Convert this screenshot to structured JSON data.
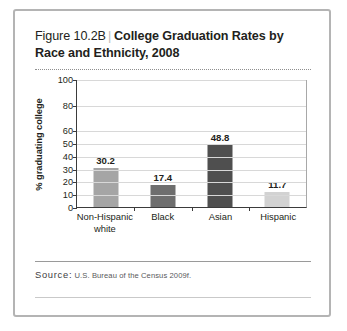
{
  "figure": {
    "number": "Figure 10.2B",
    "divider": "|",
    "title": "College Graduation Rates by Race and Ethnicity, 2008"
  },
  "source": {
    "label": "Source:",
    "citation": "U.S. Bureau of the Census 2009f."
  },
  "chart_data": {
    "type": "bar",
    "title": "College Graduation Rates by Race and Ethnicity, 2008",
    "xlabel": "",
    "ylabel": "% graduating college",
    "categories": [
      "Non-Hispanic white",
      "Black",
      "Asian",
      "Hispanic"
    ],
    "values": [
      30.2,
      17.4,
      48.8,
      11.7
    ],
    "value_labels": [
      "30.2",
      "17.4",
      "48.8",
      "11.7"
    ],
    "bar_colors": [
      "#a5a5a5",
      "#6e6e6e",
      "#4f4f4f",
      "#d2d2d2"
    ],
    "ylim": [
      0,
      100
    ],
    "ytick_values": [
      0,
      10,
      20,
      30,
      40,
      50,
      60,
      80,
      100
    ],
    "ytick_labels": [
      "0",
      "10",
      "20",
      "30",
      "40",
      "50",
      "60",
      "80",
      "100"
    ],
    "gridlines": true,
    "legend": "none"
  }
}
